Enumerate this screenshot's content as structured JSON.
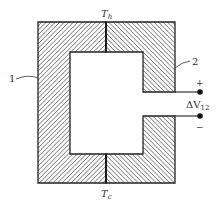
{
  "diagram": {
    "type": "thermocouple-schematic",
    "labels": {
      "hot_junction": "T",
      "hot_junction_sub": "h",
      "cold_junction": "T",
      "cold_junction_sub": "c",
      "material_1": "1",
      "material_2": "2",
      "plus": "+",
      "minus": "−",
      "voltage": "ΔV",
      "voltage_sub": "12"
    },
    "colors": {
      "stroke": "#222222",
      "background": "#ffffff"
    }
  }
}
